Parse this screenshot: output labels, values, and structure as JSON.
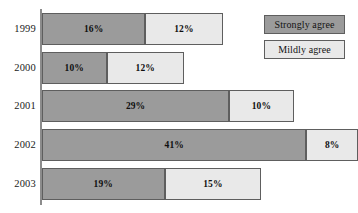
{
  "chart_data": {
    "type": "bar",
    "orientation": "horizontal",
    "stacked": true,
    "title": "",
    "subtitle": "",
    "xlabel": "",
    "ylabel": "",
    "grid": false,
    "xlim": [
      0,
      50
    ],
    "legend_position": "top-right",
    "categories": [
      "1999",
      "2000",
      "2001",
      "2002",
      "2003"
    ],
    "series": [
      {
        "name": "Strongly agree",
        "color": "#9b9b9b",
        "values": [
          16,
          10,
          29,
          41,
          19
        ],
        "labels": [
          "16%",
          "10%",
          "29%",
          "41%",
          "19%"
        ]
      },
      {
        "name": "Mildly agree",
        "color": "#e9e9e9",
        "values": [
          12,
          12,
          10,
          8,
          15
        ],
        "labels": [
          "12%",
          "12%",
          "10%",
          "8%",
          "15%"
        ]
      }
    ],
    "rows": [
      {
        "category": "1999",
        "strongly_agree": 16,
        "strongly_agree_label": "16%",
        "mildly_agree": 12,
        "mildly_agree_label": "12%"
      },
      {
        "category": "2000",
        "strongly_agree": 10,
        "strongly_agree_label": "10%",
        "mildly_agree": 12,
        "mildly_agree_label": "12%"
      },
      {
        "category": "2001",
        "strongly_agree": 29,
        "strongly_agree_label": "29%",
        "mildly_agree": 10,
        "mildly_agree_label": "10%"
      },
      {
        "category": "2002",
        "strongly_agree": 41,
        "strongly_agree_label": "41%",
        "mildly_agree": 8,
        "mildly_agree_label": "8%"
      },
      {
        "category": "2003",
        "strongly_agree": 19,
        "strongly_agree_label": "19%",
        "mildly_agree": 15,
        "mildly_agree_label": "15%"
      }
    ]
  },
  "legend": {
    "items": [
      {
        "label": "Strongly agree",
        "color": "#9b9b9b"
      },
      {
        "label": "Mildly agree",
        "color": "#e9e9e9"
      }
    ]
  },
  "colors": {
    "strongly_agree": "#9b9b9b",
    "mildly_agree": "#e9e9e9",
    "outline": "#5e5e5e",
    "axis": "#8c8c8c",
    "background": "#ffffff",
    "text": "#131313"
  },
  "geometry": {
    "px_per_percent": 6.45,
    "bar_height": 32,
    "row_tops": [
      13,
      52,
      90,
      129,
      168
    ],
    "axis_x": 40,
    "track_left": 42
  }
}
